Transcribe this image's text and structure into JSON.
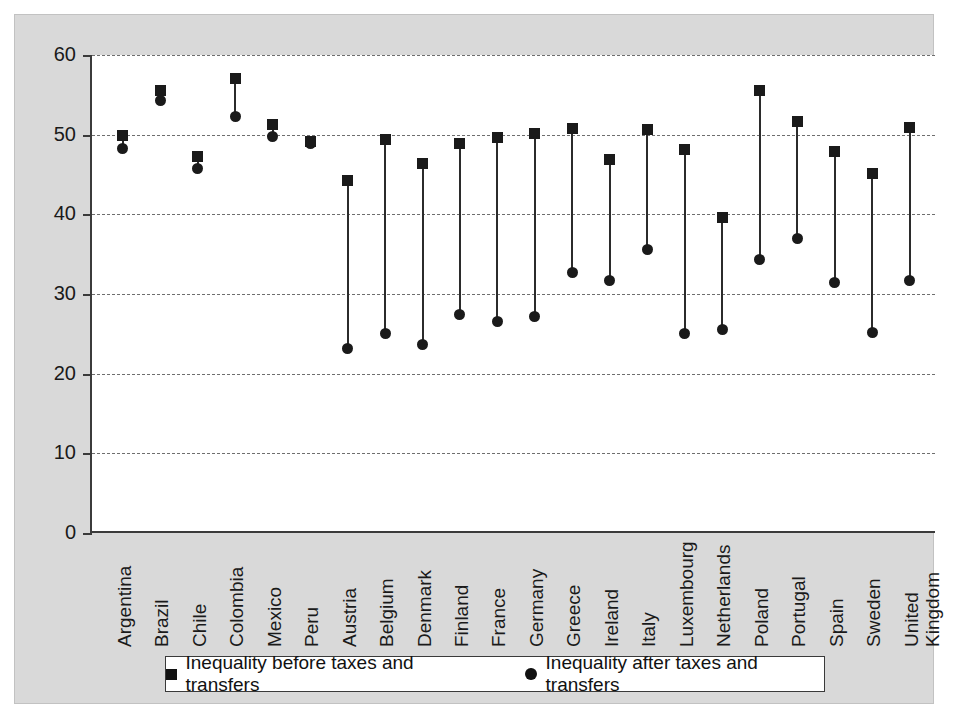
{
  "chart_data": {
    "type": "scatter",
    "title": "",
    "subtitle": "",
    "xlabel": "",
    "ylabel": "",
    "ylim": [
      0,
      60
    ],
    "yticks": [
      0,
      10,
      20,
      30,
      40,
      50,
      60
    ],
    "grid": "horizontal dashed gridlines at 10,20,30,40,50,60",
    "legend_position": "bottom",
    "categories": [
      "Argentina",
      "Brazil",
      "Chile",
      "Colombia",
      "Mexico",
      "Peru",
      "Austria",
      "Belgium",
      "Denmark",
      "Finland",
      "France",
      "Germany",
      "Greece",
      "Ireland",
      "Italy",
      "Luxembourg",
      "Netherlands",
      "Poland",
      "Portugal",
      "Spain",
      "Sweden",
      "United Kingdom"
    ],
    "category_label_lines": [
      [
        "Argentina"
      ],
      [
        "Brazil"
      ],
      [
        "Chile"
      ],
      [
        "Colombia"
      ],
      [
        "Mexico"
      ],
      [
        "Peru"
      ],
      [
        "Austria"
      ],
      [
        "Belgium"
      ],
      [
        "Denmark"
      ],
      [
        "Finland"
      ],
      [
        "France"
      ],
      [
        "Germany"
      ],
      [
        "Greece"
      ],
      [
        "Ireland"
      ],
      [
        "Italy"
      ],
      [
        "Luxembourg"
      ],
      [
        "Netherlands"
      ],
      [
        "Poland"
      ],
      [
        "Portugal"
      ],
      [
        "Spain"
      ],
      [
        "Sweden"
      ],
      [
        "United",
        "Kingdom"
      ]
    ],
    "series": [
      {
        "name": "Inequality before taxes and transfers",
        "marker": "square",
        "values": [
          49.9,
          55.6,
          47.3,
          57.0,
          51.3,
          49.2,
          44.3,
          49.4,
          46.4,
          48.9,
          49.6,
          50.2,
          50.8,
          46.9,
          50.7,
          48.2,
          39.6,
          55.5,
          51.6,
          47.9,
          45.1,
          50.9
        ]
      },
      {
        "name": "Inequality after taxes and transfers",
        "marker": "circle",
        "values": [
          48.3,
          54.3,
          45.7,
          52.3,
          49.8,
          48.9,
          23.1,
          25.1,
          23.6,
          27.4,
          26.5,
          27.2,
          32.7,
          31.7,
          35.6,
          25.0,
          25.5,
          34.3,
          37.0,
          31.5,
          25.2,
          31.7
        ]
      }
    ]
  },
  "legend": {
    "items": [
      {
        "marker": "square",
        "label": "Inequality before taxes and transfers"
      },
      {
        "marker": "circle",
        "label": "Inequality after taxes and transfers"
      }
    ]
  },
  "colors": {
    "panel_background": "#d9d9d9",
    "plot_background": "#ffffff",
    "marker": "#1a1a1a",
    "axis": "#3b3b3b",
    "gridline": "#6e6e6e"
  }
}
